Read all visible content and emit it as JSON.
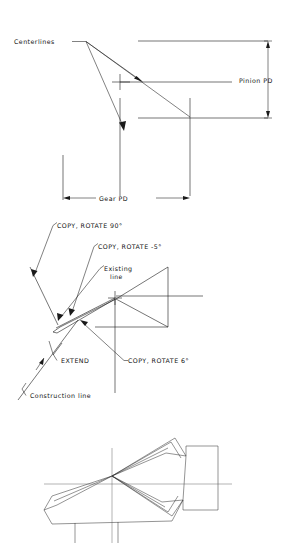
{
  "drawing": {
    "title": "Gear and pinion tooth construction layout",
    "background_color": "#ffffff",
    "line_color": "#1a1a1a",
    "text_color": "#111111"
  },
  "top_diagram": {
    "name": "pitch-diameter-layout",
    "labels": {
      "centerlines": "Centerlines",
      "pinion_pd": "Pinion PD",
      "gear_pd": "Gear PD"
    }
  },
  "middle_diagram": {
    "name": "construction-steps-layout",
    "labels": {
      "copy_rotate_90": "COPY, ROTATE 90°",
      "copy_rotate_minus5": "COPY, ROTATE -5°",
      "existing_line_1": "Existing",
      "existing_line_2": "line",
      "extend": "EXTEND",
      "copy_rotate_6": "COPY, ROTATE 6°",
      "construction_line": "Construction line"
    }
  },
  "bottom_diagram": {
    "name": "tooth-profile-result",
    "labels": {}
  }
}
